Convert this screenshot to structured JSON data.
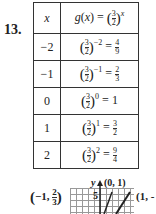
{
  "problem_number": "13.",
  "table": {
    "header": {
      "x": "x",
      "gx": "g(x) = (3/2)^x"
    },
    "rows": [
      {
        "x": "−2",
        "base_num": "3",
        "base_den": "2",
        "exp": "−2",
        "res_num": "4",
        "res_den": "9"
      },
      {
        "x": "−1",
        "base_num": "3",
        "base_den": "2",
        "exp": "−1",
        "res_num": "2",
        "res_den": "3"
      },
      {
        "x": "0",
        "base_num": "3",
        "base_den": "2",
        "exp": "0",
        "result": "1"
      },
      {
        "x": "1",
        "base_num": "3",
        "base_den": "2",
        "exp": "1",
        "res_num": "3",
        "res_den": "2"
      },
      {
        "x": "2",
        "base_num": "3",
        "base_den": "2",
        "exp": "2",
        "res_num": "9",
        "res_den": "4"
      }
    ]
  },
  "graph": {
    "point_left": "(−1, 2/3)",
    "point_left_x": "−1,",
    "point_left_num": "2",
    "point_left_den": "3",
    "point_top": "(0, 1)",
    "point_right": "(1, -",
    "y_axis_label": "y",
    "tick_label": "5"
  }
}
